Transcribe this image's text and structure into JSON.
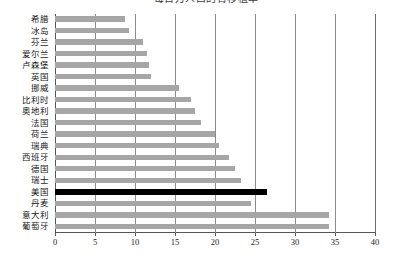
{
  "chart_data": {
    "type": "bar",
    "orientation": "horizontal",
    "title": "每百万人口的肾移植率",
    "xlabel": "",
    "ylabel": "",
    "xlim": [
      0,
      40
    ],
    "xticks": [
      0,
      5,
      10,
      15,
      20,
      25,
      30,
      35,
      40
    ],
    "grid": true,
    "legend": false,
    "highlight_category": "美国",
    "colors": {
      "bar": "#a6a6a6",
      "highlight_bar": "#000000",
      "grid": "#8a8a8a",
      "axis": "#555555",
      "background": "#ffffff"
    },
    "categories": [
      "希腊",
      "冰岛",
      "芬兰",
      "爱尔兰",
      "卢森堡",
      "英国",
      "挪威",
      "比利时",
      "奥地利",
      "法国",
      "荷兰",
      "瑞典",
      "西班牙",
      "德国",
      "瑞士",
      "美国",
      "丹麦",
      "意大利",
      "葡萄牙"
    ],
    "values": [
      8.7,
      9.2,
      11.0,
      11.5,
      11.8,
      12.0,
      15.5,
      17.0,
      17.5,
      18.3,
      20.0,
      20.5,
      21.8,
      22.5,
      23.3,
      26.5,
      24.5,
      34.3,
      34.3
    ]
  }
}
